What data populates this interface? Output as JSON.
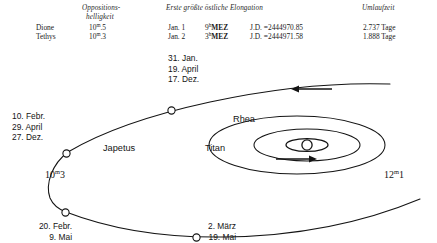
{
  "table": {
    "headers": {
      "body": "",
      "brightness": "Oppositions-",
      "brightness2": "helligkeit",
      "elongation": "Erste größte östliche Elongation",
      "period": "Umlaufzeit"
    },
    "rows": [
      {
        "body": "Dione",
        "mag_value": "10",
        "mag_sup": "m",
        "mag_frac": ".5",
        "date": "Jan. 1",
        "time_value": "9",
        "time_sup": "h",
        "time_zone": "MEZ",
        "jd_label": "J.D. =",
        "jd_value": "2444970.85",
        "period": "2.737 Tage"
      },
      {
        "body": "Tethys",
        "mag_value": "10",
        "mag_sup": "m",
        "mag_frac": ".3",
        "date": "Jan. 2",
        "time_value": "3",
        "time_sup": "h",
        "time_zone": "MEZ",
        "jd_label": "J.D. =",
        "jd_value": "2444971.58",
        "period": "1.888 Tage"
      }
    ]
  },
  "diagram": {
    "labels": {
      "upper_node": {
        "line1": "31. Jan.",
        "line2": "19. April",
        "line3": "17. Dez."
      },
      "left_node": {
        "line1": "10. Febr.",
        "line2": "29. April",
        "line3": "27. Dez."
      },
      "lower_left_node": {
        "line1": "20. Febr.",
        "line2": "9. Mai"
      },
      "lower_mid_node": {
        "line1": "2. März",
        "line2": "19. Mai"
      }
    },
    "moons": {
      "japetus": "Japetus",
      "titan": "Titan",
      "rhea": "Rhea"
    },
    "magnitudes": {
      "left": {
        "value": "10",
        "sup": "m",
        "frac": "3"
      },
      "right": {
        "value": "12",
        "sup": "m",
        "frac": "1"
      }
    },
    "icons": {
      "saturn": "saturn-with-rings-symbol",
      "arrow_upper": "arrow-left-icon",
      "arrow_lower": "arrow-right-icon"
    }
  },
  "colors": {
    "ink": "#141414",
    "background": "#ffffff"
  }
}
